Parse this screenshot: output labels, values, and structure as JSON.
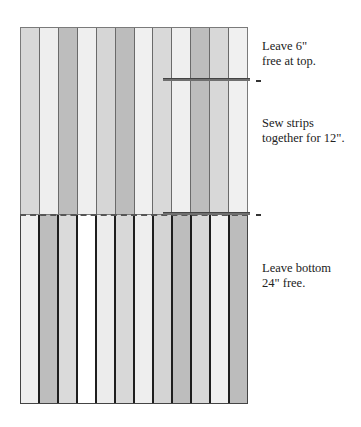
{
  "diagram": {
    "type": "sewing-strip-layout",
    "top_section": {
      "description": "Strips sewn together (upper portion)",
      "strip_colors": [
        "#d8d8d8",
        "#eeeeee",
        "#bdbdbd",
        "#efefef",
        "#d6d6d6",
        "#bcbcbc",
        "#f0f0f0",
        "#d9d9d9",
        "#efefef",
        "#bdbdbd",
        "#d8d8d8",
        "#f0f0f0"
      ]
    },
    "bottom_section": {
      "description": "Free strips (lower portion)",
      "strip_colors": [
        "#efefef",
        "#bdbdbd",
        "#dadada",
        "#ffffff",
        "#ececec",
        "#d8d8d8",
        "#eeeeee",
        "#d4d4d4",
        "#bdbdbd",
        "#d8d8d8",
        "#efefef",
        "#bcbcbc"
      ]
    },
    "annotations": [
      {
        "id": "top",
        "lines": [
          "Leave 6\"",
          "free at top."
        ]
      },
      {
        "id": "middle",
        "lines": [
          "Sew strips",
          "together for 12\"."
        ]
      },
      {
        "id": "bottom",
        "lines": [
          "Leave bottom",
          "24\" free."
        ]
      }
    ]
  }
}
